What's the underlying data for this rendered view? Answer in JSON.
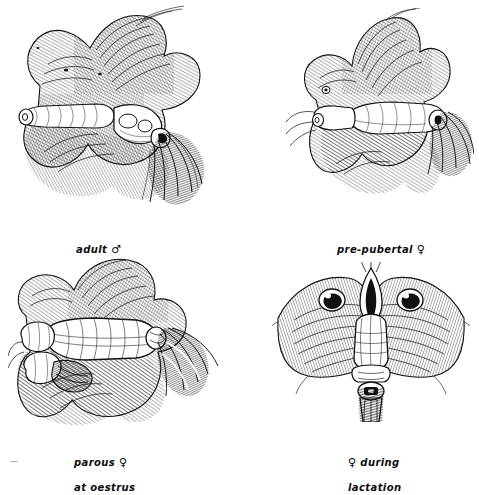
{
  "figure": {
    "background_color": "#ffffff",
    "ink_color": "#111111",
    "medium": "pen-and-ink line drawing",
    "layout": "2x2 grid of illustrations with italic captions beneath each"
  },
  "panels": [
    {
      "id": "adult-male",
      "position": "top-left",
      "caption_text": "adult ",
      "caption_symbol": "♂",
      "symbol_name": "male-symbol",
      "subject": "adult male external genitalia with surrounding fur and hair tuft"
    },
    {
      "id": "pre-pubertal-female",
      "position": "top-right",
      "caption_text": "pre-pubertal ",
      "caption_symbol": "♀",
      "symbol_name": "female-symbol",
      "subject": "pre-pubertal female external genitalia with surrounding fur"
    },
    {
      "id": "parous-female-at-oestrus",
      "position": "bottom-left",
      "caption_line1_text": "parous ",
      "caption_symbol": "♀",
      "caption_line2": "at oestrus",
      "symbol_name": "female-symbol",
      "subject": "parous female at oestrus, external genitalia"
    },
    {
      "id": "female-during-lactation",
      "position": "bottom-right",
      "caption_symbol": "♀",
      "caption_line1_text": " during",
      "caption_line2": "lactation",
      "symbol_name": "female-symbol",
      "subject": "female during lactation, external genitalia with teats visible"
    }
  ],
  "fragment": {
    "text": "—"
  }
}
